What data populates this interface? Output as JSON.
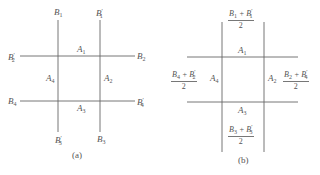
{
  "figure_a": {
    "caption": "(a)",
    "top_labels": [
      "B1",
      "B1'"
    ],
    "bottom_labels": [
      "B3'",
      "B3"
    ],
    "left_labels": [
      "B2'",
      "B4"
    ],
    "right_labels": [
      "B2",
      "B4'"
    ],
    "regions": {
      "top": "A1",
      "right": "A2",
      "bottom": "A3",
      "left": "A4"
    }
  },
  "figure_b": {
    "caption": "(b)",
    "top_fraction": {
      "numerator": "B1 + B1'",
      "denominator": "2"
    },
    "bottom_fraction": {
      "numerator": "B3 + B3'",
      "denominator": "2"
    },
    "left_fraction": {
      "numerator": "B4 + B2'",
      "denominator": "2"
    },
    "right_fraction": {
      "numerator": "B2 + B4'",
      "denominator": "2"
    },
    "regions": {
      "top": "A1",
      "right": "A2",
      "bottom": "A3",
      "left": "A4"
    }
  },
  "colors": {
    "line": "#666666",
    "text": "#555555",
    "background": "#ffffff"
  }
}
